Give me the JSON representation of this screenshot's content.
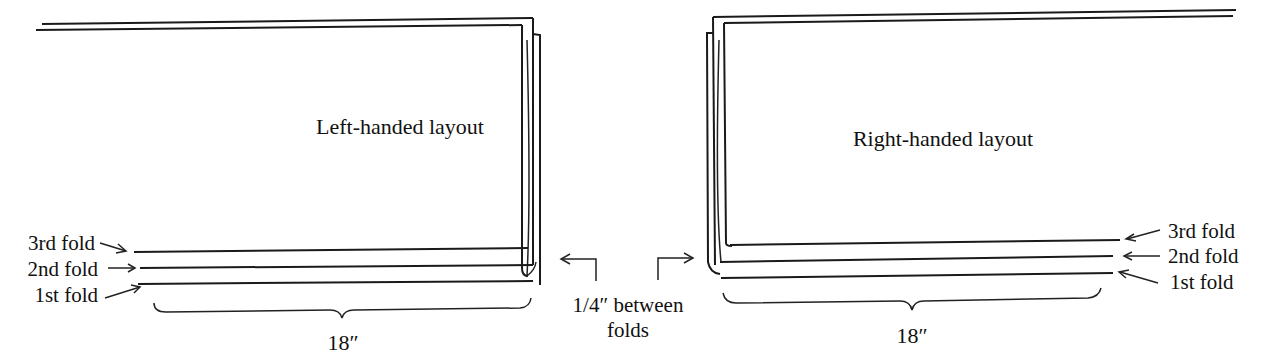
{
  "left_layout": {
    "title": "Left-handed layout",
    "labels": {
      "third": "3rd fold",
      "second": "2nd fold",
      "first": "1st fold"
    },
    "width_label": "18″"
  },
  "right_layout": {
    "title": "Right-handed layout",
    "labels": {
      "third": "3rd fold",
      "second": "2nd fold",
      "first": "1st fold"
    },
    "width_label": "18″"
  },
  "gap_note": {
    "line1": "1/4″ between",
    "line2": "folds"
  },
  "colors": {
    "ink": "#1a1a1a",
    "background": "#ffffff"
  }
}
